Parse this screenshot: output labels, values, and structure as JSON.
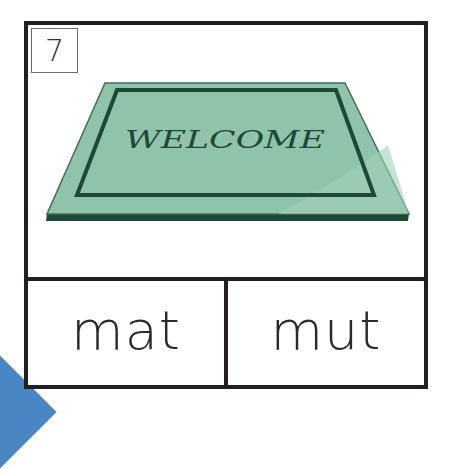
{
  "card": {
    "number": "7",
    "picture": {
      "subject": "doormat",
      "mat_text": "WELCOME",
      "colors": {
        "mat_fill": "#8fc4aa",
        "mat_highlight": "#a2d0b9",
        "mat_border": "#1d4a35",
        "mat_edge": "#3e6f57"
      }
    },
    "choices": [
      {
        "label": "mat"
      },
      {
        "label": "mut"
      }
    ]
  },
  "decoration": {
    "corner_color": "#4a86c2"
  }
}
